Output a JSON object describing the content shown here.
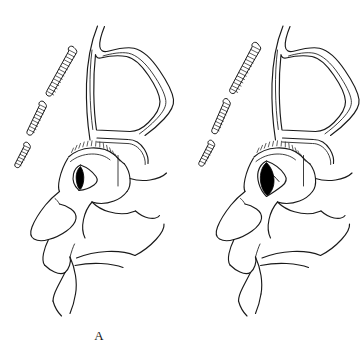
{
  "figure": {
    "type": "line-art-anatomical-illustration",
    "background_color": "#ffffff",
    "line_color": "#1a1a1a",
    "fill_color": "#000000",
    "width": 364,
    "height": 359,
    "panel_count": 2
  },
  "panels": [
    {
      "id": "panel-a",
      "label": "A",
      "description": "Lateral sagittal view of head showing nasal cavity, paranasal sinus and a deflated balloon catheter positioned in the nasal passage",
      "balloon_state": "deflated",
      "has_insertion_arrow": false,
      "structures": [
        "skull-outline",
        "sinus-cavity",
        "nasal-turbinate",
        "nose-profile",
        "lips-profile",
        "chin-profile",
        "hard-palate",
        "tongue",
        "ribbed-catheter-tube",
        "balloon"
      ]
    },
    {
      "id": "panel-b",
      "label": "B",
      "description": "Lateral sagittal view of head showing the same anatomy with the balloon catheter inflated and an arrow indicating the direction of insertion",
      "balloon_state": "inflated",
      "has_insertion_arrow": true,
      "structures": [
        "skull-outline",
        "sinus-cavity",
        "nasal-turbinate",
        "nose-profile",
        "lips-profile",
        "chin-profile",
        "hard-palate",
        "tongue",
        "ribbed-catheter-tube",
        "balloon",
        "insertion-arrow"
      ]
    }
  ]
}
